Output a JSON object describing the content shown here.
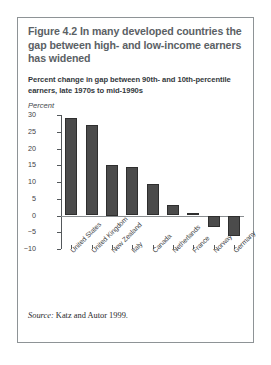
{
  "figure": {
    "title": "Figure 4.2  In many developed countries the gap between high- and low-income earners has widened",
    "subtitle": "Percent change in gap between 90th- and 10th-percentile earners, late 1970s to mid-1990s",
    "axis_title": "Percent",
    "source_label": "Source:",
    "source_text": " Katz and Autor 1999."
  },
  "colors": {
    "bar_fill": "#4b4b4b",
    "bar_stroke": "#2e2e2e",
    "title_text": "#5b6165",
    "frame": "#8e9396"
  },
  "chart_data": {
    "type": "bar",
    "title": "Percent change in gap between 90th- and 10th-percentile earners, late 1970s to mid-1990s",
    "xlabel": "",
    "ylabel": "Percent",
    "ylim": [
      -10,
      30
    ],
    "yticks": [
      30,
      25,
      20,
      15,
      10,
      5,
      0,
      -5,
      -10
    ],
    "ytick_labels": [
      "30",
      "25",
      "20",
      "15",
      "10",
      "5",
      "0",
      "−5",
      "−10"
    ],
    "grid": false,
    "legend": false,
    "categories": [
      "United States",
      "United Kingdom",
      "New Zealand",
      "Italy",
      "Canada",
      "Netherlands",
      "France",
      "Norway",
      "Germany"
    ],
    "values": [
      29,
      27,
      15,
      14.5,
      9.5,
      3,
      0.8,
      -3.5,
      -6
    ]
  }
}
